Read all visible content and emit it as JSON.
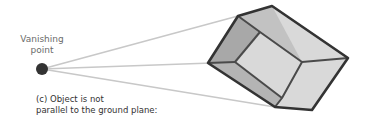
{
  "diagram": {
    "vanishing_point_label_line1": "Vanishing",
    "vanishing_point_label_line2": "point",
    "caption_line1": "(c) Object is not",
    "caption_line2": "parallel to the ground plane:",
    "colors": {
      "vanishing_point": "#333333",
      "perspective_lines": "#c8c8c8",
      "cube_edges": "#333333",
      "cube_front_face": "#a9a9a9",
      "cube_side_face": "#d6d6d6"
    }
  }
}
